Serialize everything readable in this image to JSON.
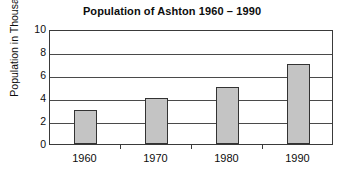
{
  "chart_data": {
    "type": "bar",
    "title": "Population of Ashton 1960 – 1990",
    "xlabel": "",
    "ylabel": "Population in Thousands",
    "categories": [
      "1960",
      "1970",
      "1980",
      "1990"
    ],
    "values": [
      3,
      4,
      5,
      7
    ],
    "series": [
      {
        "name": "Population in Thousands",
        "values": [
          3,
          4,
          5,
          7
        ]
      }
    ],
    "ylim": [
      0,
      10
    ],
    "y_ticks": [
      0,
      2,
      4,
      6,
      8,
      10
    ],
    "y_tick_labels": [
      "0",
      "2",
      "4",
      "6",
      "8",
      "10"
    ],
    "grid": true,
    "grid_axis": "y",
    "legend": false,
    "legend_position": "none",
    "bar_color": "#c4c4c4",
    "bar_edge_color": "#333333",
    "axis_color": "#3a3a3a",
    "background_color": "#ffffff",
    "text_color": "#0d0d0d"
  }
}
